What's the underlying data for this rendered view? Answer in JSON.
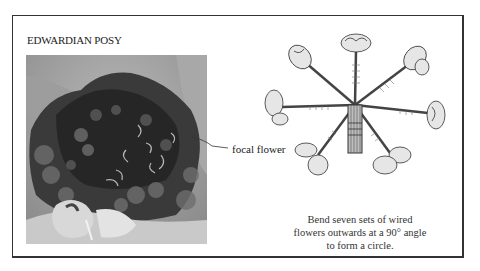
{
  "page": {
    "title": "EDWARDIAN POSY",
    "photo": {
      "alt": "Photograph of Edwardian posy bouquet with dark flowers and pale ribbon"
    },
    "callout": {
      "label": "focal flower"
    },
    "diagram": {
      "alt": "Illustration of seven wired flowers bent outwards around a central stem bundle",
      "flower_count": 7
    },
    "caption": {
      "lines": [
        "Bend seven sets of wired",
        "flowers outwards at a 90° angle",
        "to form a circle."
      ]
    }
  }
}
